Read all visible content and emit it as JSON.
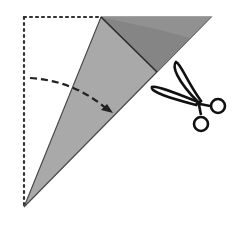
{
  "diagram": {
    "type": "paper-folding-instruction",
    "colors": {
      "background": "#ffffff",
      "paper_light": "#a9a9a9",
      "paper_dark": "#7d7d7d",
      "outline": "#2a2a2a",
      "dotted_outline": "#333333",
      "scissors": "#111111"
    },
    "elements": [
      {
        "name": "original-square-outline",
        "style": "dotted"
      },
      {
        "name": "folded-paper-triangle",
        "style": "filled-gray"
      },
      {
        "name": "folded-flap",
        "style": "filled-dark-gray"
      },
      {
        "name": "fold-arrow",
        "style": "dashed-with-arrowhead"
      },
      {
        "name": "scissors-icon",
        "style": "outline"
      }
    ]
  }
}
